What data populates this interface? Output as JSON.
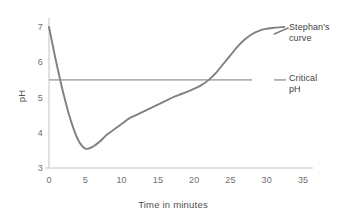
{
  "chart_data": {
    "type": "line",
    "title": "",
    "xlabel": "Time in minutes",
    "ylabel": "pH",
    "xlim": [
      0,
      35
    ],
    "ylim": [
      3,
      7.3
    ],
    "xticks": [
      "0",
      "5",
      "10",
      "15",
      "20",
      "25",
      "30",
      "35"
    ],
    "xtick_values": [
      0,
      5,
      10,
      15,
      20,
      25,
      30,
      35
    ],
    "yticks": [
      "3",
      "4",
      "5",
      "6",
      "7"
    ],
    "ytick_values": [
      3,
      4,
      5,
      6,
      7
    ],
    "grid": false,
    "legend_position": "right-inline-annotations",
    "series": [
      {
        "name": "Stephan's curve",
        "color": "#808080",
        "label_line1": "Stephan's",
        "label_line2": "curve",
        "x": [
          0,
          1,
          2,
          3,
          4,
          5,
          6,
          7,
          8,
          9,
          10,
          11,
          12,
          13,
          14,
          15,
          16,
          17,
          18,
          19,
          20,
          21,
          22,
          23,
          24,
          25,
          26,
          27,
          28,
          29,
          30,
          31,
          32.4
        ],
        "values": [
          7.0,
          6.0,
          5.1,
          4.35,
          3.8,
          3.55,
          3.6,
          3.75,
          3.95,
          4.1,
          4.25,
          4.4,
          4.5,
          4.6,
          4.7,
          4.8,
          4.9,
          5.0,
          5.08,
          5.16,
          5.25,
          5.35,
          5.5,
          5.7,
          5.95,
          6.2,
          6.45,
          6.65,
          6.8,
          6.9,
          6.95,
          6.98,
          7.0
        ]
      },
      {
        "name": "Critical pH",
        "color": "#b2b2b2",
        "label_line1": "Critical",
        "label_line2": "pH",
        "type": "horizontal-reference-line",
        "y_value": 5.5,
        "x_start": 0,
        "x_end": 35
      }
    ],
    "annotations": [
      {
        "id": "minimum",
        "x": 5,
        "y": 3.5,
        "note": "curve minimum"
      },
      {
        "id": "critical-crossing-down",
        "x": 1.6,
        "y": 5.5,
        "note": "curve falls below critical pH"
      },
      {
        "id": "critical-crossing-up",
        "x": 22.5,
        "y": 5.5,
        "note": "curve rises above critical pH"
      }
    ]
  },
  "axes": {
    "x_title": "Time in minutes",
    "y_title": "pH"
  },
  "labels": {
    "stephans_curve_line1": "Stephan's",
    "stephans_curve_line2": "curve",
    "critical_ph_line1": "Critical",
    "critical_ph_line2": "pH"
  },
  "ticks": {
    "x": [
      "0",
      "5",
      "10",
      "15",
      "20",
      "25",
      "30",
      "35"
    ],
    "y": [
      "3",
      "4",
      "5",
      "6",
      "7"
    ]
  },
  "colors": {
    "curve": "#808080",
    "critical_line": "#b2b2b2",
    "axis": "#c8c8c8",
    "tick_text": "#6f6f6f",
    "annotation_text": "#3f3f3f",
    "background": "#ffffff"
  }
}
